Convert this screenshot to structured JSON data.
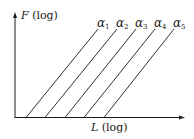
{
  "diagram": {
    "y_axis_label": {
      "var": "F",
      "suffix": " (log)"
    },
    "x_axis_label": {
      "var": "L",
      "suffix": " (log)"
    },
    "lines": [
      {
        "symbol": "α",
        "sub": "1",
        "x0": 26,
        "x1": 98
      },
      {
        "symbol": "α",
        "sub": "2",
        "x0": 45,
        "x1": 117
      },
      {
        "symbol": "α",
        "sub": "3",
        "x0": 65,
        "x1": 136
      },
      {
        "symbol": "α",
        "sub": "4",
        "x0": 84,
        "x1": 155
      },
      {
        "symbol": "α",
        "sub": "5",
        "x0": 104,
        "x1": 174
      }
    ],
    "colors": {
      "ink": "#1a1a1a",
      "background": "#ffffff"
    }
  }
}
